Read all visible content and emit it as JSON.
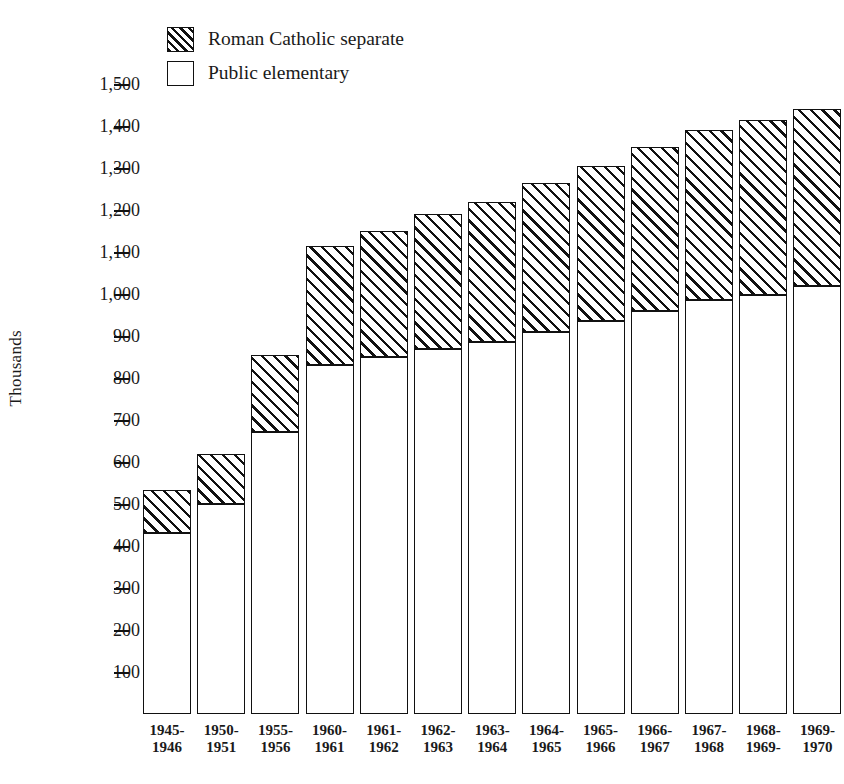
{
  "chart_data": {
    "type": "bar",
    "subtype": "stacked-vertical",
    "title": "",
    "xlabel": "",
    "ylabel": "Thousands",
    "ylim": [
      0,
      1500
    ],
    "grid": false,
    "legend_position": "top-left",
    "y_ticks": [
      "100",
      "200",
      "300",
      "400",
      "500",
      "600",
      "700",
      "800",
      "900",
      "1,000",
      "1,100",
      "1,200",
      "1,300",
      "1,400",
      "1,500"
    ],
    "y_tick_values": [
      100,
      200,
      300,
      400,
      500,
      600,
      700,
      800,
      900,
      1000,
      1100,
      1200,
      1300,
      1400,
      1500
    ],
    "categories": [
      "1945-\n1946",
      "1950-\n1951",
      "1955-\n1956",
      "1960-\n1961",
      "1961-\n1962",
      "1962-\n1963",
      "1963-\n1964",
      "1964-\n1965",
      "1965-\n1966",
      "1966-\n1967",
      "1967-\n1968",
      "1968-\n1969-",
      "1969-\n1970"
    ],
    "category_lines": [
      [
        "1945-",
        "1946"
      ],
      [
        "1950-",
        "1951"
      ],
      [
        "1955-",
        "1956"
      ],
      [
        "1960-",
        "1961"
      ],
      [
        "1961-",
        "1962"
      ],
      [
        "1962-",
        "1963"
      ],
      [
        "1963-",
        "1964"
      ],
      [
        "1964-",
        "1965"
      ],
      [
        "1965-",
        "1966"
      ],
      [
        "1966-",
        "1967"
      ],
      [
        "1967-",
        "1968"
      ],
      [
        "1968-",
        "1969-"
      ],
      [
        "1969-",
        "1970"
      ]
    ],
    "series": [
      {
        "name": "Public elementary",
        "fill": "white",
        "values": [
          430,
          500,
          672,
          830,
          850,
          868,
          885,
          910,
          935,
          960,
          985,
          997,
          1020
        ]
      },
      {
        "name": "Roman Catholic separate",
        "fill": "hatched",
        "values": [
          103,
          120,
          183,
          285,
          300,
          322,
          335,
          355,
          370,
          390,
          405,
          418,
          420
        ]
      }
    ],
    "totals": [
      533,
      620,
      855,
      1115,
      1150,
      1190,
      1220,
      1265,
      1305,
      1350,
      1390,
      1415,
      1440
    ]
  },
  "legend": {
    "items": [
      {
        "label": "Roman Catholic separate",
        "fill": "hatched"
      },
      {
        "label": "Public elementary",
        "fill": "white"
      }
    ]
  },
  "axis": {
    "y_title": "Thousands"
  },
  "colors": {
    "ink": "#111111",
    "paper": "#ffffff"
  }
}
